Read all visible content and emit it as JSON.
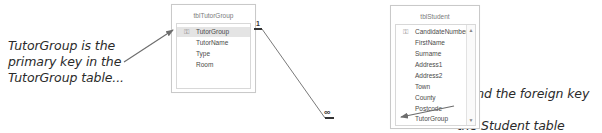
{
  "annotations": {
    "left": [
      "TutorGroup is the",
      "primary key in the",
      "TutorGroup table..."
    ],
    "right": [
      "...and the foreign key in",
      "the Student table"
    ]
  },
  "tables": {
    "tutor_group": {
      "title": "tblTutorGroup",
      "fields": [
        "TutorGroup",
        "TutorName",
        "Type",
        "Room"
      ],
      "primary_key": "TutorGroup"
    },
    "student": {
      "title": "tblStudent",
      "fields": [
        "CandidateNumber",
        "FirstName",
        "Surname",
        "Address1",
        "Address2",
        "Town",
        "County",
        "Postcode",
        "TutorGroup"
      ],
      "primary_key": "CandidateNumber"
    }
  },
  "relationship": {
    "one_side_label": "1",
    "many_side_label": "∞",
    "from": "tblTutorGroup.TutorGroup",
    "to": "tblStudent.TutorGroup"
  },
  "icons": {
    "key": "⚿",
    "scroll_up": "▲",
    "scroll_down": "▼"
  },
  "colors": {
    "line": "#6d6d6d",
    "selected_row": "#e4e4e4",
    "border": "#c9c9c9"
  }
}
